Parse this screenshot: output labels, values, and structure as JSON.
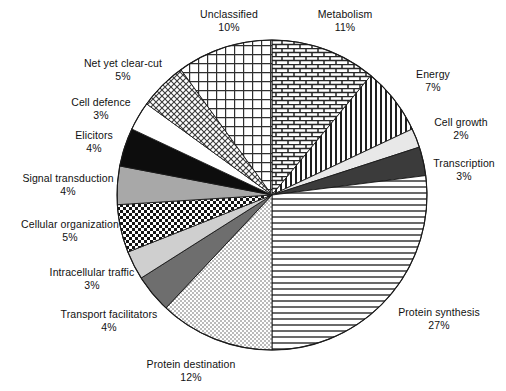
{
  "chart_data": {
    "type": "pie",
    "title": "",
    "subtitle": "",
    "xlabel": "",
    "ylabel": "",
    "legend_position": "none",
    "grid": false,
    "units": "percent",
    "start_angle_deg": 0,
    "direction": "clockwise",
    "center": {
      "x": 272,
      "y": 195
    },
    "radius": 155,
    "categories": [
      "Metabolism",
      "Energy",
      "Cell growth",
      "Transcription",
      "Protein synthesis",
      "Protein destination",
      "Transport facilitators",
      "Intracellular traffic",
      "Cellular organization",
      "Signal transduction",
      "Elicitors",
      "Cell defence",
      "Net yet clear-cut",
      "Unclassified"
    ],
    "values": [
      11,
      7,
      2,
      3,
      27,
      12,
      4,
      3,
      5,
      4,
      4,
      3,
      5,
      10
    ],
    "value_labels": [
      "11%",
      "7%",
      "2%",
      "3%",
      "27%",
      "12%",
      "4%",
      "3%",
      "5%",
      "4%",
      "4%",
      "3%",
      "5%",
      "10%"
    ],
    "slices": [
      {
        "label": "Metabolism",
        "value": 11,
        "value_label": "11%",
        "fill": "brick",
        "color": "#ffffff"
      },
      {
        "label": "Energy",
        "value": 7,
        "value_label": "7%",
        "fill": "vertical-lines",
        "color": "#ffffff"
      },
      {
        "label": "Cell growth",
        "value": 2,
        "value_label": "2%",
        "fill": "solid",
        "color": "#e8e8e8"
      },
      {
        "label": "Transcription",
        "value": 3,
        "value_label": "3%",
        "fill": "solid",
        "color": "#3b3b3b"
      },
      {
        "label": "Protein synthesis",
        "value": 27,
        "value_label": "27%",
        "fill": "horizontal-lines",
        "color": "#ffffff"
      },
      {
        "label": "Protein destination",
        "value": 12,
        "value_label": "12%",
        "fill": "fine-dots",
        "color": "#fbfbfb"
      },
      {
        "label": "Transport facilitators",
        "value": 4,
        "value_label": "4%",
        "fill": "solid",
        "color": "#6e6e6e"
      },
      {
        "label": "Intracellular traffic",
        "value": 3,
        "value_label": "3%",
        "fill": "solid",
        "color": "#cfcfcf"
      },
      {
        "label": "Cellular organization",
        "value": 5,
        "value_label": "5%",
        "fill": "checkerboard",
        "color": "#ffffff"
      },
      {
        "label": "Signal transduction",
        "value": 4,
        "value_label": "4%",
        "fill": "solid",
        "color": "#a8a8a8"
      },
      {
        "label": "Elicitors",
        "value": 4,
        "value_label": "4%",
        "fill": "solid",
        "color": "#0d0d0d"
      },
      {
        "label": "Cell defence",
        "value": 3,
        "value_label": "3%",
        "fill": "solid",
        "color": "#ffffff"
      },
      {
        "label": "Net yet clear-cut",
        "value": 5,
        "value_label": "5%",
        "fill": "diagonal-cross",
        "color": "#ffffff"
      },
      {
        "label": "Unclassified",
        "value": 10,
        "value_label": "10%",
        "fill": "grid",
        "color": "#ffffff"
      }
    ]
  },
  "labels": {
    "unclassified": {
      "name": "Unclassified",
      "pct": "10%"
    },
    "metabolism": {
      "name": "Metabolism",
      "pct": "11%"
    },
    "energy": {
      "name": "Energy",
      "pct": "7%"
    },
    "cell_growth": {
      "name": "Cell growth",
      "pct": "2%"
    },
    "transcription": {
      "name": "Transcription",
      "pct": "3%"
    },
    "protein_synthesis": {
      "name": "Protein synthesis",
      "pct": "27%"
    },
    "protein_destination": {
      "name": "Protein destination",
      "pct": "12%"
    },
    "transport_facilitators": {
      "name": "Transport facilitators",
      "pct": "4%"
    },
    "intracellular_traffic": {
      "name": "Intracellular traffic",
      "pct": "3%"
    },
    "cellular_organization": {
      "name": "Cellular organization",
      "pct": "5%"
    },
    "signal_transduction": {
      "name": "Signal transduction",
      "pct": "4%"
    },
    "elicitors": {
      "name": "Elicitors",
      "pct": "4%"
    },
    "cell_defence": {
      "name": "Cell defence",
      "pct": "3%"
    },
    "net_yet_clear_cut": {
      "name": "Net yet clear-cut",
      "pct": "5%"
    }
  },
  "style": {
    "stroke": "#1a1a1a",
    "background": "#ffffff",
    "text": "#111111"
  }
}
